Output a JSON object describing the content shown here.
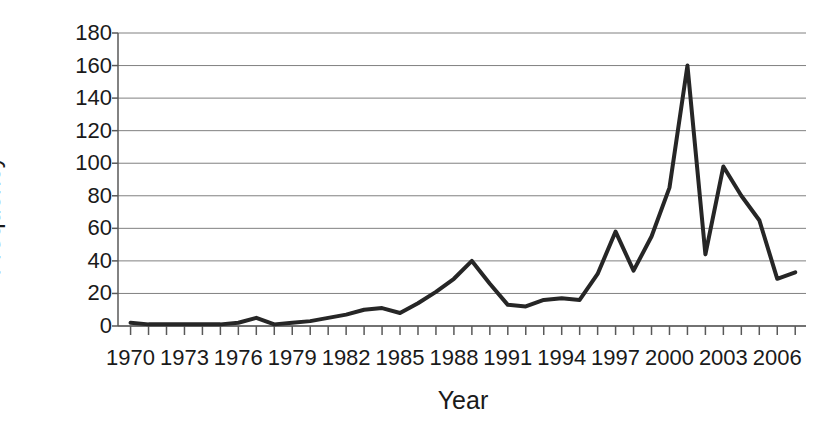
{
  "chart_data": {
    "type": "line",
    "title": "",
    "xlabel": "Year",
    "ylabel": "Frequency",
    "xlim": [
      1969.3,
      2007.6
    ],
    "ylim": [
      0,
      180
    ],
    "ytick_step": 20,
    "yticks": [
      0,
      20,
      40,
      60,
      80,
      100,
      120,
      140,
      160,
      180
    ],
    "xticks": [
      1970,
      1973,
      1976,
      1979,
      1982,
      1985,
      1988,
      1991,
      1994,
      1997,
      2000,
      2003,
      2006
    ],
    "xtick_minor_step": 1,
    "grid": "horizontal",
    "legend": "none",
    "line_color": "#262626",
    "line_width": 4,
    "x": [
      1970,
      1971,
      1972,
      1973,
      1974,
      1975,
      1976,
      1977,
      1978,
      1979,
      1980,
      1981,
      1982,
      1983,
      1984,
      1985,
      1986,
      1987,
      1988,
      1989,
      1990,
      1991,
      1992,
      1993,
      1994,
      1995,
      1996,
      1997,
      1998,
      1999,
      2000,
      2001,
      2002,
      2003,
      2004,
      2005,
      2006,
      2007
    ],
    "values": [
      2,
      1,
      1,
      1,
      1,
      1,
      2,
      5,
      1,
      2,
      3,
      5,
      7,
      10,
      11,
      8,
      14,
      21,
      29,
      40,
      26,
      13,
      12,
      16,
      17,
      16,
      32,
      58,
      34,
      55,
      85,
      160,
      44,
      98,
      80,
      65,
      29,
      33
    ]
  },
  "axis": {
    "ytick_labels": [
      "180",
      "160",
      "140",
      "120",
      "100",
      "80",
      "60",
      "40",
      "20",
      "0"
    ],
    "xtick_labels": [
      "1970",
      "1973",
      "1976",
      "1979",
      "1982",
      "1985",
      "1988",
      "1991",
      "1994",
      "1997",
      "2000",
      "2003",
      "2006"
    ]
  }
}
